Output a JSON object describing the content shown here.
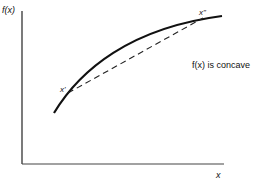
{
  "diagram": {
    "y_axis_label": "f(x)",
    "x_axis_label": "x",
    "point_left_label": "x'",
    "point_right_label": "x\"",
    "caption": "f(x) is concave",
    "colors": {
      "ink": "#111111",
      "background": "#ffffff"
    }
  }
}
